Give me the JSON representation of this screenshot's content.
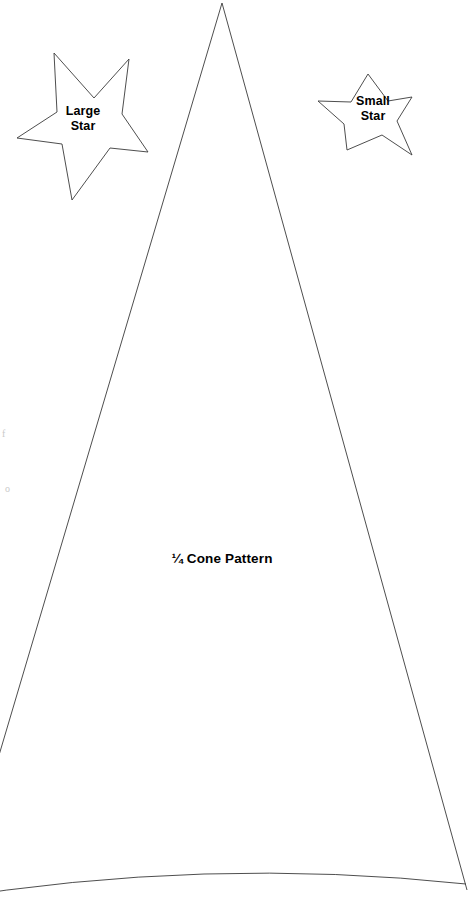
{
  "page": {
    "background_color": "#ffffff",
    "stroke_color": "#3a3a3a",
    "text_color": "#000000",
    "width": 472,
    "height": 907
  },
  "shapes": {
    "large_star": {
      "name": "Large Star",
      "label": "Large\nStar",
      "label_line_1": "Large",
      "label_line_2": "Star",
      "outline_points": "54,53 94,98 129,59 122,114 148,152 110,148 72,200 62,144 17,138 57,112",
      "stroke_color": "#3a3a3a",
      "fill": "none"
    },
    "small_star": {
      "name": "Small Star",
      "label": "Small\nStar",
      "label_line_1": "Small",
      "label_line_2": "Star",
      "outline_points": "368,74 388,101 412,97 397,121 412,155 382,135 347,150 344,124 318,101 351,102",
      "stroke_color": "#3a3a3a",
      "fill": "none"
    },
    "cone_pattern": {
      "name": "Quarter Cone Pattern",
      "label": "¼ Cone Pattern",
      "fraction": "¼",
      "label_rest": "Cone Pattern",
      "apex": "222,3",
      "left_edge_end": "-46,907",
      "right_edge_end": "465,883",
      "base_arc": "M -46,907 Q 210,852 465,883",
      "stroke_color": "#3a3a3a",
      "fill": "none"
    }
  },
  "margin_marks": [
    {
      "glyph": "f"
    },
    {
      "glyph": "o"
    }
  ]
}
